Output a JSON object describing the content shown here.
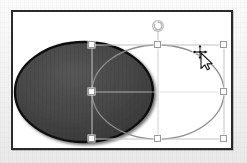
{
  "app": {
    "canvas_label": "Slide canvas",
    "background_color": "#f1f1f1",
    "canvas_color": "#ffffff",
    "canvas_border_color": "#2a2a2a"
  },
  "shapes": [
    {
      "id": "ellipse-filled",
      "name": "Filled oval",
      "type": "ellipse",
      "cx": 82,
      "cy": 90,
      "rx": 69,
      "ry": 50,
      "fill_color": "#414141",
      "stroke_color": "#111111",
      "stroke_width": 2.4,
      "selected": "false",
      "shadow": "true"
    },
    {
      "id": "ellipse-outline",
      "name": "Selected oval",
      "type": "ellipse",
      "cx": 156,
      "cy": 90,
      "rx": 66,
      "ry": 47,
      "fill_color": "none",
      "stroke_color": "#8d8d8d",
      "stroke_width": 1.3,
      "selected": "true",
      "shadow": "false"
    }
  ],
  "selection": {
    "label": "Selection bounding box",
    "box": {
      "left": 90,
      "top": 43,
      "width": 132,
      "height": 94
    },
    "outline_color": "#c2c2c2",
    "handle_fill": "#fdfdfd",
    "handle_stroke": "#9a9a9a",
    "handles": [
      {
        "name": "handle-top-left",
        "x": 90,
        "y": 43,
        "resize": "nwse-resize"
      },
      {
        "name": "handle-top-center",
        "x": 156,
        "y": 43,
        "resize": "ns-resize"
      },
      {
        "name": "handle-top-right",
        "x": 222,
        "y": 43,
        "resize": "nesw-resize"
      },
      {
        "name": "handle-middle-left",
        "x": 90,
        "y": 90,
        "resize": "ew-resize"
      },
      {
        "name": "handle-middle-right",
        "x": 222,
        "y": 90,
        "resize": "ew-resize"
      },
      {
        "name": "handle-bottom-left",
        "x": 90,
        "y": 137,
        "resize": "nwse-resize"
      },
      {
        "name": "handle-bottom-center",
        "x": 156,
        "y": 137,
        "resize": "ns-resize"
      },
      {
        "name": "handle-bottom-right",
        "x": 222,
        "y": 137,
        "resize": "nwse-resize"
      }
    ],
    "rotation_handle": {
      "name": "rotation-handle",
      "x": 156,
      "y": 24,
      "stem_from_y": 43,
      "color": "#b9b9b9",
      "tooltip": "Rotate"
    }
  },
  "cursor": {
    "name": "move-copy-cursor",
    "x": 200,
    "y": 52,
    "type": "move-copy",
    "label": "Move / duplicate pointer"
  }
}
